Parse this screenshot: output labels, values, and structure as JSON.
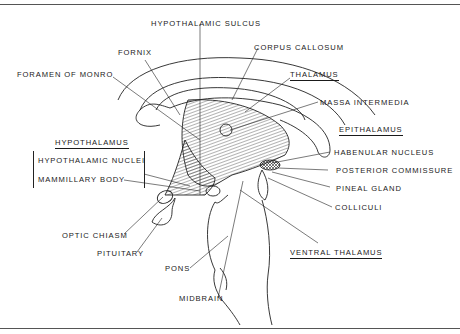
{
  "figure": {
    "labels": {
      "hypothalamic_sulcus": "HYPOTHALAMIC SULCUS",
      "corpus_callosum": "CORPUS CALLOSUM",
      "fornix": "FORNIX",
      "foramen_of_monro": "FORAMEN OF MONRO",
      "thalamus": "THALAMUS",
      "massa_intermedia": "MASSA INTERMEDIA",
      "epithalamus": "EPITHALAMUS",
      "hypothalamus": "HYPOTHALAMUS",
      "hypothalamic_nuclei": "HYPOTHALAMIC NUCLEI",
      "mammillary_body": "MAMMILLARY BODY",
      "habenular_nucleus": "HABENULAR NUCLEUS",
      "posterior_commissure": "POSTERIOR COMMISSURE",
      "pineal_gland": "PINEAL GLAND",
      "colliculi": "COLLICULI",
      "optic_chiasm": "OPTIC CHIASM",
      "pituitary": "PITUITARY",
      "pons": "PONS",
      "ventral_thalamus": "VENTRAL THALAMUS",
      "midbrain": "MIDBRAIN"
    },
    "underlined_headings": [
      "THALAMUS",
      "EPITHALAMUS",
      "HYPOTHALAMUS",
      "VENTRAL THALAMUS"
    ],
    "colors": {
      "ink": "#1a1a1a",
      "background": "#ffffff",
      "rule": "#555555"
    }
  }
}
